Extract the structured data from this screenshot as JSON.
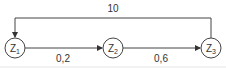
{
  "diagram": {
    "nodes": [
      {
        "id": "z1",
        "label": "Z",
        "subscript": "1"
      },
      {
        "id": "z2",
        "label": "Z",
        "subscript": "2"
      },
      {
        "id": "z3",
        "label": "Z",
        "subscript": "3"
      }
    ],
    "edges": [
      {
        "from": "z1",
        "to": "z2",
        "label": "0,2"
      },
      {
        "from": "z2",
        "to": "z3",
        "label": "0,6"
      },
      {
        "from": "z3",
        "to": "z1",
        "label": "10"
      }
    ],
    "colors": {
      "line": "#444444",
      "text": "#333333",
      "baseline": "#e6e6e6"
    }
  }
}
